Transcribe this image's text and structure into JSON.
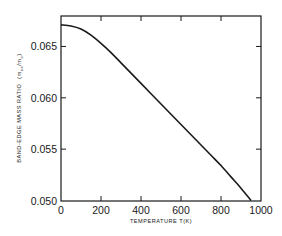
{
  "chart_data": {
    "type": "line",
    "title": "",
    "xlabel": "TEMPERATURE  T(K)",
    "ylabel": "BAND-EDGE MASS RATIO  (m_oe/m_o)",
    "ylabel_main": "BAND-EDGE MASS RATIO",
    "ylabel_unit_open": "(m",
    "ylabel_unit_sub1": "oe",
    "ylabel_unit_mid": "/m",
    "ylabel_unit_sub2": "o",
    "ylabel_unit_close": ")",
    "xlim": [
      0,
      1000
    ],
    "ylim": [
      0.05,
      0.0685
    ],
    "x_ticks": [
      0,
      200,
      400,
      600,
      800,
      1000
    ],
    "x_tick_labels": [
      "0",
      "200",
      "400",
      "600",
      "800",
      "1000"
    ],
    "y_ticks": [
      0.05,
      0.055,
      0.06,
      0.065
    ],
    "y_tick_labels": [
      "0.050",
      "0.055",
      "0.060",
      "0.065"
    ],
    "grid": false,
    "legend": null,
    "series": [
      {
        "name": "band-edge mass ratio",
        "color": "#1a1a1a",
        "x": [
          0,
          50,
          100,
          150,
          200,
          250,
          300,
          350,
          400,
          450,
          500,
          550,
          600,
          650,
          700,
          750,
          800,
          850,
          900,
          950
        ],
        "y": [
          0.0671,
          0.067,
          0.0667,
          0.0661,
          0.0653,
          0.0644,
          0.0634,
          0.0624,
          0.0614,
          0.0604,
          0.0594,
          0.0584,
          0.0574,
          0.0564,
          0.0554,
          0.0544,
          0.0534,
          0.0523,
          0.0512,
          0.05
        ]
      }
    ]
  }
}
